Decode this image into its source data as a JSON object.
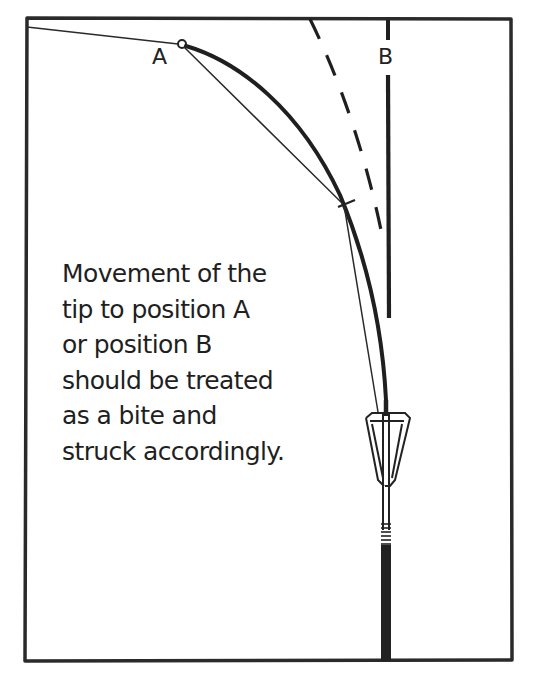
{
  "diagram": {
    "type": "illustration",
    "labels": {
      "position_a": "A",
      "position_b": "B"
    },
    "caption_lines": [
      "Movement of the",
      "tip to position A",
      "or position B",
      "should be treated",
      "as a bite and",
      "struck accordingly."
    ],
    "elements": [
      {
        "name": "frame",
        "style": "solid border"
      },
      {
        "name": "line-to-position-a",
        "style": "thin solid"
      },
      {
        "name": "rod-tip-position-a",
        "style": "thick curve"
      },
      {
        "name": "rod-position-dashed",
        "style": "dashed curve"
      },
      {
        "name": "rod-tip-position-b",
        "style": "thick straight vertical"
      },
      {
        "name": "fishing-line",
        "style": "thin solid"
      },
      {
        "name": "quiver-tip-funnel",
        "style": "outline"
      },
      {
        "name": "rod-butt",
        "style": "thick vertical"
      }
    ],
    "colors": {
      "ink": "#1f1f1f",
      "background": "#ffffff"
    }
  }
}
